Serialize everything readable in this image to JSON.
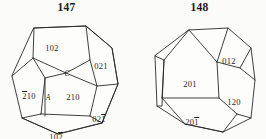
{
  "document": {
    "type": "crystallography-figure-pair",
    "background_color": "#fbfbfa",
    "line_color": "#2a2a2a"
  },
  "figures": [
    {
      "number": "147",
      "shape_name": "pyritohedron",
      "face_labels": [
        {
          "id": "f147-top",
          "text": "102",
          "overbar_digits": [],
          "x": 52,
          "y": 30
        },
        {
          "id": "f147-upper-right",
          "text": "021",
          "overbar_digits": [],
          "x": 101,
          "y": 48
        },
        {
          "id": "f147-left",
          "text": "210",
          "overbar_digits": [
            0
          ],
          "x": 29,
          "y": 78
        },
        {
          "id": "f147-right",
          "text": "210",
          "overbar_digits": [],
          "x": 72,
          "y": 79
        },
        {
          "id": "f147-lower-right",
          "text": "021",
          "overbar_digits": [
            2
          ],
          "x": 99,
          "y": 101
        },
        {
          "id": "f147-bottom",
          "text": "102",
          "overbar_digits": [
            2
          ],
          "x": 55,
          "y": 119
        }
      ],
      "vertex_labels": [
        {
          "id": "f147-vertex-c",
          "text": "C",
          "x": 66,
          "y": 55
        },
        {
          "id": "f147-vertex-a",
          "text": "A",
          "x": 48,
          "y": 79
        }
      ]
    },
    {
      "number": "148",
      "shape_name": "pyritohedron",
      "face_labels": [
        {
          "id": "f148-upper-right",
          "text": "012",
          "overbar_digits": [],
          "x": 96,
          "y": 43
        },
        {
          "id": "f148-left",
          "text": "201",
          "overbar_digits": [],
          "x": 57,
          "y": 66
        },
        {
          "id": "f148-right",
          "text": "120",
          "overbar_digits": [],
          "x": 101,
          "y": 84
        },
        {
          "id": "f148-bottom",
          "text": "201",
          "overbar_digits": [
            2
          ],
          "x": 59,
          "y": 104
        }
      ],
      "vertex_labels": []
    }
  ]
}
